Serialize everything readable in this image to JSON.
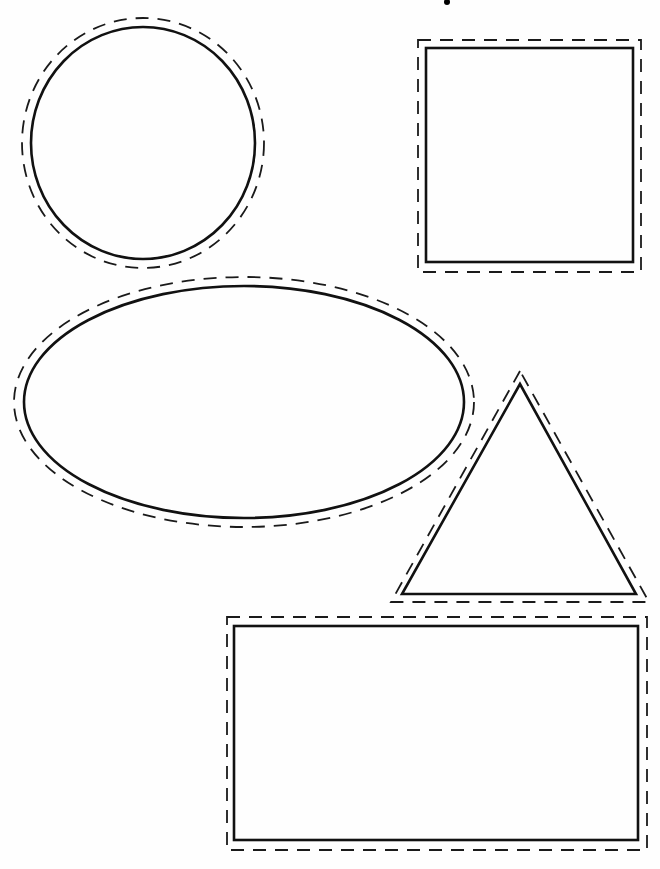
{
  "page": {
    "width": 660,
    "height": 869,
    "background": "#fefefe",
    "stroke_color": "#111111"
  },
  "shapes": [
    {
      "name": "circle",
      "type": "ellipse",
      "solid": {
        "cx": 143,
        "cy": 143,
        "rx": 112,
        "ry": 116
      },
      "dashed": {
        "cx": 143,
        "cy": 143,
        "rx": 121,
        "ry": 125
      }
    },
    {
      "name": "square",
      "type": "rect",
      "solid": {
        "x": 426,
        "y": 48,
        "w": 207,
        "h": 214
      },
      "dashed": {
        "x": 418,
        "y": 40,
        "w": 223,
        "h": 232
      }
    },
    {
      "name": "oval",
      "type": "ellipse",
      "solid": {
        "cx": 244,
        "cy": 402,
        "rx": 220,
        "ry": 116
      },
      "dashed": {
        "cx": 244,
        "cy": 402,
        "rx": 230,
        "ry": 125
      }
    },
    {
      "name": "triangle",
      "type": "polygon",
      "solid": {
        "points": "520,384 402,594 636,594"
      },
      "dashed": {
        "points": "520,371 391,602 649,602"
      }
    },
    {
      "name": "rectangle",
      "type": "rect",
      "solid": {
        "x": 234,
        "y": 626,
        "w": 404,
        "h": 214
      },
      "dashed": {
        "x": 227,
        "y": 617,
        "w": 420,
        "h": 233
      }
    }
  ],
  "marks": [
    {
      "name": "stray-dot",
      "cx": 447,
      "cy": 2,
      "r": 3
    }
  ]
}
